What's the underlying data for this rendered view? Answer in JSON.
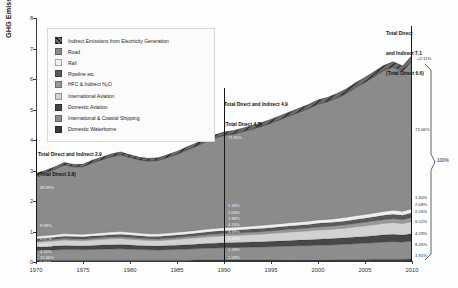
{
  "chart_data": {
    "type": "area",
    "title": "",
    "xlabel": "",
    "ylabel": "GHG Emissions [GtCO2 eq/yr]",
    "ylabel_main": "GHG Emissions [GtCO",
    "ylabel_sub": "2",
    "ylabel_tail": " eq/yr]",
    "xlim": [
      1970,
      2010
    ],
    "ylim": [
      0,
      8
    ],
    "grid": false,
    "legend_position": "top-left",
    "x_ticks": [
      "1970",
      "1975",
      "1980",
      "1985",
      "1990",
      "1995",
      "2000",
      "2005",
      "2010"
    ],
    "y_ticks": [
      "0",
      "1",
      "2",
      "3",
      "4",
      "5",
      "6",
      "7",
      "8"
    ],
    "x": [
      1970,
      1971,
      1972,
      1973,
      1974,
      1975,
      1976,
      1977,
      1978,
      1979,
      1980,
      1981,
      1982,
      1983,
      1984,
      1985,
      1986,
      1987,
      1988,
      1989,
      1990,
      1991,
      1992,
      1993,
      1994,
      1995,
      1996,
      1997,
      1998,
      1999,
      2000,
      2001,
      2002,
      2003,
      2004,
      2005,
      2006,
      2007,
      2008,
      2009,
      2010
    ],
    "series": [
      {
        "name": "Domestic Waterborne",
        "color": "#3b3b3b",
        "values": [
          0.055,
          0.056,
          0.057,
          0.058,
          0.058,
          0.058,
          0.059,
          0.06,
          0.061,
          0.061,
          0.06,
          0.059,
          0.058,
          0.058,
          0.059,
          0.06,
          0.061,
          0.062,
          0.063,
          0.064,
          0.065,
          0.065,
          0.066,
          0.067,
          0.068,
          0.069,
          0.07,
          0.072,
          0.073,
          0.074,
          0.076,
          0.077,
          0.079,
          0.081,
          0.083,
          0.085,
          0.087,
          0.09,
          0.092,
          0.092,
          0.095
        ]
      },
      {
        "name": "International & Coastal Shipping",
        "color": "#8e8e8e",
        "values": [
          0.32,
          0.33,
          0.34,
          0.352,
          0.348,
          0.342,
          0.352,
          0.36,
          0.368,
          0.372,
          0.362,
          0.35,
          0.34,
          0.336,
          0.344,
          0.352,
          0.362,
          0.372,
          0.384,
          0.394,
          0.402,
          0.406,
          0.412,
          0.418,
          0.424,
          0.432,
          0.44,
          0.45,
          0.456,
          0.462,
          0.474,
          0.48,
          0.49,
          0.502,
          0.518,
          0.53,
          0.546,
          0.562,
          0.576,
          0.56,
          0.59
        ]
      },
      {
        "name": "Domestic Aviation",
        "color": "#474747",
        "values": [
          0.118,
          0.122,
          0.126,
          0.132,
          0.13,
          0.128,
          0.132,
          0.136,
          0.14,
          0.142,
          0.138,
          0.134,
          0.132,
          0.132,
          0.136,
          0.14,
          0.145,
          0.15,
          0.156,
          0.16,
          0.164,
          0.166,
          0.168,
          0.171,
          0.174,
          0.178,
          0.182,
          0.186,
          0.19,
          0.194,
          0.2,
          0.202,
          0.206,
          0.21,
          0.218,
          0.224,
          0.23,
          0.238,
          0.242,
          0.236,
          0.248
        ]
      },
      {
        "name": "International Aviation",
        "color": "#d2d2d2",
        "values": [
          0.158,
          0.165,
          0.172,
          0.18,
          0.176,
          0.174,
          0.18,
          0.186,
          0.192,
          0.196,
          0.19,
          0.184,
          0.18,
          0.18,
          0.186,
          0.192,
          0.2,
          0.208,
          0.218,
          0.226,
          0.232,
          0.236,
          0.24,
          0.246,
          0.252,
          0.26,
          0.268,
          0.276,
          0.284,
          0.292,
          0.302,
          0.306,
          0.314,
          0.324,
          0.338,
          0.35,
          0.364,
          0.378,
          0.386,
          0.376,
          0.398
        ]
      },
      {
        "name": "HFC & Indirect N2O",
        "color": "#9a9a9a",
        "values": [
          0.04,
          0.042,
          0.044,
          0.046,
          0.046,
          0.046,
          0.048,
          0.05,
          0.052,
          0.053,
          0.052,
          0.051,
          0.05,
          0.051,
          0.053,
          0.055,
          0.058,
          0.06,
          0.063,
          0.066,
          0.068,
          0.07,
          0.072,
          0.074,
          0.077,
          0.08,
          0.083,
          0.086,
          0.089,
          0.092,
          0.096,
          0.098,
          0.101,
          0.104,
          0.108,
          0.112,
          0.116,
          0.12,
          0.124,
          0.124,
          0.132
        ]
      },
      {
        "name": "Pipeline etc.",
        "color": "#5a5a5a",
        "values": [
          0.07,
          0.072,
          0.074,
          0.077,
          0.077,
          0.076,
          0.078,
          0.08,
          0.082,
          0.084,
          0.083,
          0.081,
          0.08,
          0.08,
          0.082,
          0.084,
          0.087,
          0.089,
          0.092,
          0.095,
          0.097,
          0.098,
          0.1,
          0.102,
          0.104,
          0.106,
          0.109,
          0.111,
          0.114,
          0.116,
          0.12,
          0.121,
          0.124,
          0.127,
          0.131,
          0.134,
          0.138,
          0.142,
          0.146,
          0.145,
          0.152
        ]
      },
      {
        "name": "Rail",
        "color": "#efefef",
        "values": [
          0.082,
          0.083,
          0.084,
          0.086,
          0.086,
          0.085,
          0.086,
          0.088,
          0.089,
          0.09,
          0.089,
          0.088,
          0.087,
          0.087,
          0.088,
          0.089,
          0.091,
          0.092,
          0.094,
          0.096,
          0.097,
          0.098,
          0.099,
          0.1,
          0.102,
          0.103,
          0.105,
          0.107,
          0.108,
          0.11,
          0.112,
          0.113,
          0.115,
          0.117,
          0.12,
          0.122,
          0.125,
          0.128,
          0.13,
          0.128,
          0.133
        ]
      },
      {
        "name": "Road",
        "color": "#8b8b8b",
        "values": [
          1.985,
          2.06,
          2.145,
          2.25,
          2.2,
          2.215,
          2.32,
          2.395,
          2.47,
          2.52,
          2.455,
          2.4,
          2.385,
          2.405,
          2.48,
          2.56,
          2.665,
          2.76,
          2.87,
          2.96,
          3.03,
          3.06,
          3.12,
          3.18,
          3.25,
          3.33,
          3.42,
          3.51,
          3.6,
          3.69,
          3.8,
          3.86,
          3.95,
          4.06,
          4.21,
          4.34,
          4.48,
          4.62,
          4.7,
          4.6,
          4.84
        ]
      },
      {
        "name": "Indirect Emissions from Electricity Generation",
        "color": "#6d6d6d",
        "hatched": true,
        "values": [
          0.072,
          0.074,
          0.076,
          0.079,
          0.078,
          0.078,
          0.08,
          0.083,
          0.085,
          0.087,
          0.086,
          0.084,
          0.084,
          0.085,
          0.088,
          0.091,
          0.094,
          0.097,
          0.101,
          0.104,
          0.106,
          0.108,
          0.11,
          0.112,
          0.115,
          0.118,
          0.121,
          0.124,
          0.128,
          0.131,
          0.135,
          0.137,
          0.14,
          0.144,
          0.149,
          0.154,
          0.159,
          0.164,
          0.168,
          0.166,
          0.175
        ]
      }
    ],
    "annotations": [
      {
        "id": "a1970",
        "line1": "Total Direct and Indirect 2.9",
        "line2": "(Total Direct 2.8)",
        "x": 1970
      },
      {
        "id": "a1990",
        "line1": "Total Direct and Indirect 4.9",
        "line2": "(Total Direct 4.7)",
        "x": 1990
      },
      {
        "id": "a2010",
        "line1": "Total Direct",
        "line2": "and Indirect 7.1",
        "line3": "(Total Direct 6.6)",
        "x": 2010
      }
    ],
    "growth_label": "+2.11%",
    "total_label": "100%",
    "left_percents": [
      {
        "label": "2.47%"
      },
      {
        "label": "68.89%"
      },
      {
        "label": "9.58%"
      },
      {
        "label": "2.97%"
      },
      {
        "label": "5.55%"
      },
      {
        "label": "4.11%"
      },
      {
        "label": "11.66%"
      },
      {
        "label": "1.91%"
      }
    ],
    "mid_percents": [
      {
        "label": "71.85%"
      },
      {
        "label": "1.34%"
      },
      {
        "label": "2.00%"
      },
      {
        "label": "1.98%"
      },
      {
        "label": "4.74%"
      },
      {
        "label": "3.39%"
      },
      {
        "label": "8.34%"
      },
      {
        "label": "1.34%"
      },
      {
        "label": "1.29%"
      }
    ],
    "right_percents": [
      {
        "label": "72.06%"
      },
      {
        "label": "1.60%"
      },
      {
        "label": "2.08%"
      },
      {
        "label": "2.16%"
      },
      {
        "label": "6.52%"
      },
      {
        "label": "4.19%"
      },
      {
        "label": "8.26%"
      },
      {
        "label": "1.91%"
      }
    ]
  },
  "legend": {
    "items": [
      {
        "label": "Indirect Emissions from Electricity Generation",
        "color": "#6d6d6d",
        "hatched": true
      },
      {
        "label": "Road",
        "color": "#8b8b8b",
        "hatched": false
      },
      {
        "label": "Rail",
        "color": "#efefef",
        "hatched": false
      },
      {
        "label": "Pipeline etc.",
        "color": "#5a5a5a",
        "hatched": false
      },
      {
        "label": "HFC & Indirect N2O",
        "color": "#9a9a9a",
        "hatched": false,
        "sub": "2"
      },
      {
        "label": "International Aviation",
        "color": "#d2d2d2",
        "hatched": false
      },
      {
        "label": "Domestic Aviation",
        "color": "#474747",
        "hatched": false
      },
      {
        "label": "International & Coastal Shipping",
        "color": "#8e8e8e",
        "hatched": false
      },
      {
        "label": "Domestic Waterborne",
        "color": "#3b3b3b",
        "hatched": false
      }
    ]
  }
}
